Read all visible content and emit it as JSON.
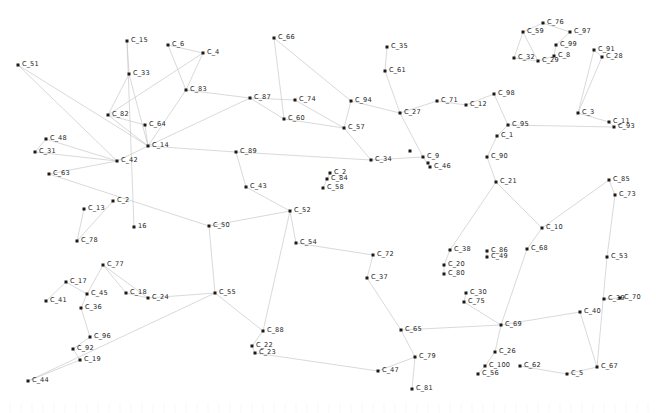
{
  "view": {
    "title": "Network Graph",
    "width": 656,
    "height": 413,
    "background_color": "#ffffff",
    "node_color": "#1a1a1a",
    "label_color": "#1e1e1e",
    "edge_color": "#c9c9c9"
  },
  "chart_data": {
    "type": "scatter",
    "title": "",
    "xlabel": "",
    "ylabel": "",
    "layout": "force-directed node-link diagram",
    "grid": false,
    "legend": "none",
    "node_count": 100,
    "edge_count": 100,
    "xlim": [
      0,
      656
    ],
    "ylim": [
      0,
      413
    ],
    "nodes": [
      {
        "id": "C_51",
        "label": "C_51",
        "x": 18,
        "y": 65
      },
      {
        "id": "C_15",
        "label": "C_15",
        "x": 127,
        "y": 41
      },
      {
        "id": "C_6",
        "label": "C_6",
        "x": 168,
        "y": 45
      },
      {
        "id": "C_4",
        "label": "C_4",
        "x": 203,
        "y": 53
      },
      {
        "id": "C_33",
        "label": "C_33",
        "x": 129,
        "y": 74
      },
      {
        "id": "C_83",
        "label": "C_83",
        "x": 186,
        "y": 90
      },
      {
        "id": "C_66",
        "label": "C_66",
        "x": 274,
        "y": 38
      },
      {
        "id": "C_35",
        "label": "C_35",
        "x": 387,
        "y": 47
      },
      {
        "id": "C_61",
        "label": "C_61",
        "x": 385,
        "y": 71
      },
      {
        "id": "C_87",
        "label": "C_87",
        "x": 250,
        "y": 98
      },
      {
        "id": "C_74",
        "label": "C_74",
        "x": 295,
        "y": 100
      },
      {
        "id": "C_94",
        "label": "C_94",
        "x": 351,
        "y": 101
      },
      {
        "id": "C_27",
        "label": "C_27",
        "x": 400,
        "y": 113
      },
      {
        "id": "C_71",
        "label": "C_71",
        "x": 437,
        "y": 101
      },
      {
        "id": "C_12",
        "label": "C_12",
        "x": 466,
        "y": 105
      },
      {
        "id": "C_98",
        "label": "C_98",
        "x": 494,
        "y": 94
      },
      {
        "id": "C_76",
        "label": "C_76",
        "x": 543,
        "y": 23
      },
      {
        "id": "C_59",
        "label": "C_59",
        "x": 523,
        "y": 32
      },
      {
        "id": "C_97",
        "label": "C_97",
        "x": 570,
        "y": 32
      },
      {
        "id": "C_99",
        "label": "C_99",
        "x": 556,
        "y": 45
      },
      {
        "id": "C_8",
        "label": "C_8",
        "x": 554,
        "y": 56
      },
      {
        "id": "C_32",
        "label": "C_32",
        "x": 514,
        "y": 58
      },
      {
        "id": "C_29",
        "label": "C_29",
        "x": 538,
        "y": 61
      },
      {
        "id": "C_91",
        "label": "C_91",
        "x": 594,
        "y": 50
      },
      {
        "id": "C_28",
        "label": "C_28",
        "x": 602,
        "y": 57
      },
      {
        "id": "C_3",
        "label": "C_3",
        "x": 578,
        "y": 113
      },
      {
        "id": "C_11",
        "label": "C_11",
        "x": 609,
        "y": 122
      },
      {
        "id": "C_93",
        "label": "C_93",
        "x": 614,
        "y": 127
      },
      {
        "id": "C_95",
        "label": "C_95",
        "x": 508,
        "y": 125
      },
      {
        "id": "C_1",
        "label": "C_1",
        "x": 497,
        "y": 136
      },
      {
        "id": "C_90",
        "label": "C_90",
        "x": 487,
        "y": 157
      },
      {
        "id": "C_21",
        "label": "C_21",
        "x": 496,
        "y": 182
      },
      {
        "id": "C_82",
        "label": "C_82",
        "x": 108,
        "y": 115
      },
      {
        "id": "C_64",
        "label": "C_64",
        "x": 145,
        "y": 125
      },
      {
        "id": "C_48",
        "label": "C_48",
        "x": 46,
        "y": 139
      },
      {
        "id": "C_14",
        "label": "C_14",
        "x": 148,
        "y": 146
      },
      {
        "id": "C_31",
        "label": "C_31",
        "x": 35,
        "y": 152
      },
      {
        "id": "C_42",
        "label": "C_42",
        "x": 117,
        "y": 161
      },
      {
        "id": "C_63",
        "label": "C_63",
        "x": 49,
        "y": 174
      },
      {
        "id": "C_60",
        "label": "C_60",
        "x": 284,
        "y": 119
      },
      {
        "id": "C_57",
        "label": "C_57",
        "x": 344,
        "y": 128
      },
      {
        "id": "C_89",
        "label": "C_89",
        "x": 236,
        "y": 152
      },
      {
        "id": "C_34",
        "label": "C_34",
        "x": 371,
        "y": 160
      },
      {
        "id": "C_9",
        "label": "C_9",
        "x": 423,
        "y": 157
      },
      {
        "id": "C_46",
        "label": "C_46",
        "x": 430,
        "y": 167
      },
      {
        "id": "C_2",
        "label": "C_2",
        "x": 330,
        "y": 173
      },
      {
        "id": "C_84",
        "label": "C_84",
        "x": 327,
        "y": 179
      },
      {
        "id": "C_58",
        "label": "C_58",
        "x": 323,
        "y": 188
      },
      {
        "id": "C_43",
        "label": "C_43",
        "x": 246,
        "y": 187
      },
      {
        "id": "C_85",
        "label": "C_85",
        "x": 609,
        "y": 180
      },
      {
        "id": "C_73",
        "label": "C_73",
        "x": 615,
        "y": 195
      },
      {
        "id": "C_13",
        "label": "C_13",
        "x": 84,
        "y": 209
      },
      {
        "id": "C_2b",
        "label": "C_2",
        "x": 113,
        "y": 201
      },
      {
        "id": "C_16",
        "label": "16",
        "x": 134,
        "y": 227
      },
      {
        "id": "C_78",
        "label": "C_78",
        "x": 77,
        "y": 241
      },
      {
        "id": "C_50",
        "label": "C_50",
        "x": 209,
        "y": 226
      },
      {
        "id": "C_52",
        "label": "C_52",
        "x": 290,
        "y": 211
      },
      {
        "id": "C_54",
        "label": "C_54",
        "x": 296,
        "y": 243
      },
      {
        "id": "C_10",
        "label": "C_10",
        "x": 542,
        "y": 228
      },
      {
        "id": "C_72",
        "label": "C_72",
        "x": 373,
        "y": 255
      },
      {
        "id": "C_38",
        "label": "C_38",
        "x": 450,
        "y": 250
      },
      {
        "id": "C_86",
        "label": "C_86",
        "x": 487,
        "y": 251
      },
      {
        "id": "C_49",
        "label": "C_49",
        "x": 487,
        "y": 257
      },
      {
        "id": "C_68",
        "label": "C_68",
        "x": 527,
        "y": 249
      },
      {
        "id": "C_53",
        "label": "C_53",
        "x": 607,
        "y": 257
      },
      {
        "id": "C_20",
        "label": "C_20",
        "x": 444,
        "y": 265
      },
      {
        "id": "C_80",
        "label": "C_80",
        "x": 444,
        "y": 274
      },
      {
        "id": "C_37",
        "label": "C_37",
        "x": 367,
        "y": 278
      },
      {
        "id": "C_77",
        "label": "C_77",
        "x": 103,
        "y": 265
      },
      {
        "id": "C_17",
        "label": "C_17",
        "x": 66,
        "y": 282
      },
      {
        "id": "C_45",
        "label": "C_45",
        "x": 87,
        "y": 294
      },
      {
        "id": "C_18",
        "label": "C_18",
        "x": 126,
        "y": 293
      },
      {
        "id": "C_24",
        "label": "C_24",
        "x": 148,
        "y": 298
      },
      {
        "id": "C_55",
        "label": "C_55",
        "x": 215,
        "y": 293
      },
      {
        "id": "C_41",
        "label": "C_41",
        "x": 46,
        "y": 301
      },
      {
        "id": "C_36",
        "label": "C_36",
        "x": 81,
        "y": 308
      },
      {
        "id": "C_30",
        "label": "C_30",
        "x": 466,
        "y": 293
      },
      {
        "id": "C_75",
        "label": "C_75",
        "x": 464,
        "y": 302
      },
      {
        "id": "C_39",
        "label": "C_39",
        "x": 604,
        "y": 299
      },
      {
        "id": "C_70",
        "label": "C_70",
        "x": 620,
        "y": 298
      },
      {
        "id": "C_40",
        "label": "C_40",
        "x": 580,
        "y": 312
      },
      {
        "id": "C_69",
        "label": "C_69",
        "x": 501,
        "y": 325
      },
      {
        "id": "C_65",
        "label": "C_65",
        "x": 401,
        "y": 330
      },
      {
        "id": "C_88",
        "label": "C_88",
        "x": 263,
        "y": 331
      },
      {
        "id": "C_96",
        "label": "C_96",
        "x": 90,
        "y": 337
      },
      {
        "id": "C_22",
        "label": "C_22",
        "x": 252,
        "y": 346
      },
      {
        "id": "C_23",
        "label": "C_23",
        "x": 255,
        "y": 353
      },
      {
        "id": "C_92",
        "label": "C_92",
        "x": 73,
        "y": 349
      },
      {
        "id": "C_19",
        "label": "C_19",
        "x": 80,
        "y": 360
      },
      {
        "id": "C_79",
        "label": "C_79",
        "x": 415,
        "y": 357
      },
      {
        "id": "C_26",
        "label": "C_26",
        "x": 495,
        "y": 352
      },
      {
        "id": "C_100",
        "label": "C_100",
        "x": 485,
        "y": 366
      },
      {
        "id": "C_62",
        "label": "C_62",
        "x": 520,
        "y": 366
      },
      {
        "id": "C_56",
        "label": "C_56",
        "x": 478,
        "y": 374
      },
      {
        "id": "C_5",
        "label": "C_5",
        "x": 567,
        "y": 374
      },
      {
        "id": "C_67",
        "label": "C_67",
        "x": 597,
        "y": 367
      },
      {
        "id": "C_47",
        "label": "C_47",
        "x": 378,
        "y": 371
      },
      {
        "id": "C_81",
        "label": "C_81",
        "x": 412,
        "y": 389
      },
      {
        "id": "C_44",
        "label": "C_44",
        "x": 28,
        "y": 381
      },
      {
        "id": "C_25",
        "label": "",
        "x": 410,
        "y": 151
      },
      {
        "id": "C_7",
        "label": "",
        "x": 428,
        "y": 163
      }
    ],
    "edges": [
      [
        "C_51",
        "C_42"
      ],
      [
        "C_51",
        "C_14"
      ],
      [
        "C_15",
        "C_33"
      ],
      [
        "C_15",
        "C_16"
      ],
      [
        "C_6",
        "C_4"
      ],
      [
        "C_6",
        "C_83"
      ],
      [
        "C_4",
        "C_83"
      ],
      [
        "C_4",
        "C_82"
      ],
      [
        "C_33",
        "C_14"
      ],
      [
        "C_33",
        "C_82"
      ],
      [
        "C_83",
        "C_87"
      ],
      [
        "C_83",
        "C_14"
      ],
      [
        "C_66",
        "C_60"
      ],
      [
        "C_66",
        "C_94"
      ],
      [
        "C_35",
        "C_61"
      ],
      [
        "C_61",
        "C_27"
      ],
      [
        "C_87",
        "C_60"
      ],
      [
        "C_87",
        "C_14"
      ],
      [
        "C_87",
        "C_74"
      ],
      [
        "C_74",
        "C_57"
      ],
      [
        "C_94",
        "C_27"
      ],
      [
        "C_94",
        "C_57"
      ],
      [
        "C_27",
        "C_71"
      ],
      [
        "C_27",
        "C_9"
      ],
      [
        "C_71",
        "C_12"
      ],
      [
        "C_12",
        "C_98"
      ],
      [
        "C_98",
        "C_95"
      ],
      [
        "C_76",
        "C_59"
      ],
      [
        "C_76",
        "C_97"
      ],
      [
        "C_59",
        "C_32"
      ],
      [
        "C_59",
        "C_29"
      ],
      [
        "C_99",
        "C_8"
      ],
      [
        "C_8",
        "C_29"
      ],
      [
        "C_97",
        "C_99"
      ],
      [
        "C_32",
        "C_29"
      ],
      [
        "C_91",
        "C_28"
      ],
      [
        "C_91",
        "C_3"
      ],
      [
        "C_28",
        "C_3"
      ],
      [
        "C_3",
        "C_11"
      ],
      [
        "C_11",
        "C_93"
      ],
      [
        "C_95",
        "C_1"
      ],
      [
        "C_1",
        "C_90"
      ],
      [
        "C_90",
        "C_21"
      ],
      [
        "C_21",
        "C_10"
      ],
      [
        "C_82",
        "C_64"
      ],
      [
        "C_82",
        "C_14"
      ],
      [
        "C_64",
        "C_14"
      ],
      [
        "C_48",
        "C_31"
      ],
      [
        "C_48",
        "C_42"
      ],
      [
        "C_31",
        "C_42"
      ],
      [
        "C_42",
        "C_14"
      ],
      [
        "C_42",
        "C_63"
      ],
      [
        "C_63",
        "C_50"
      ],
      [
        "C_60",
        "C_57"
      ],
      [
        "C_57",
        "C_34"
      ],
      [
        "C_89",
        "C_43"
      ],
      [
        "C_89",
        "C_34"
      ],
      [
        "C_34",
        "C_9"
      ],
      [
        "C_9",
        "C_46"
      ],
      [
        "C_2",
        "C_84"
      ],
      [
        "C_84",
        "C_58"
      ],
      [
        "C_43",
        "C_52"
      ],
      [
        "C_85",
        "C_73"
      ],
      [
        "C_73",
        "C_53"
      ],
      [
        "C_13",
        "C_78"
      ],
      [
        "C_2b",
        "C_78"
      ],
      [
        "C_50",
        "C_52"
      ],
      [
        "C_50",
        "C_55"
      ],
      [
        "C_52",
        "C_54"
      ],
      [
        "C_54",
        "C_72"
      ],
      [
        "C_10",
        "C_68"
      ],
      [
        "C_72",
        "C_37"
      ],
      [
        "C_38",
        "C_20"
      ],
      [
        "C_20",
        "C_80"
      ],
      [
        "C_86",
        "C_49"
      ],
      [
        "C_68",
        "C_69"
      ],
      [
        "C_37",
        "C_65"
      ],
      [
        "C_77",
        "C_24"
      ],
      [
        "C_77",
        "C_45"
      ],
      [
        "C_17",
        "C_45"
      ],
      [
        "C_45",
        "C_36"
      ],
      [
        "C_18",
        "C_24"
      ],
      [
        "C_41",
        "C_17"
      ],
      [
        "C_36",
        "C_96"
      ],
      [
        "C_30",
        "C_75"
      ],
      [
        "C_75",
        "C_69"
      ],
      [
        "C_39",
        "C_70"
      ],
      [
        "C_40",
        "C_69"
      ],
      [
        "C_69",
        "C_26"
      ],
      [
        "C_65",
        "C_79"
      ],
      [
        "C_88",
        "C_22"
      ],
      [
        "C_22",
        "C_23"
      ],
      [
        "C_96",
        "C_92"
      ],
      [
        "C_92",
        "C_19"
      ],
      [
        "C_79",
        "C_81"
      ],
      [
        "C_26",
        "C_100"
      ],
      [
        "C_100",
        "C_56"
      ],
      [
        "C_62",
        "C_5"
      ],
      [
        "C_5",
        "C_67"
      ],
      [
        "C_47",
        "C_79"
      ],
      [
        "C_44",
        "C_19"
      ],
      [
        "C_44",
        "C_55"
      ],
      [
        "C_55",
        "C_88"
      ],
      [
        "C_23",
        "C_47"
      ],
      [
        "C_40",
        "C_67"
      ],
      [
        "C_65",
        "C_69"
      ],
      [
        "C_14",
        "C_89"
      ],
      [
        "C_24",
        "C_55"
      ],
      [
        "C_52",
        "C_88"
      ],
      [
        "C_18",
        "C_77"
      ],
      [
        "C_95",
        "C_93"
      ],
      [
        "C_21",
        "C_38"
      ],
      [
        "C_10",
        "C_85"
      ],
      [
        "C_53",
        "C_67"
      ]
    ]
  }
}
